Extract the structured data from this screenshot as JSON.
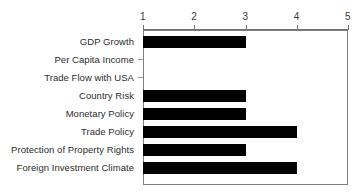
{
  "chart_data": {
    "type": "bar",
    "orientation": "horizontal",
    "title": "",
    "subtitle": "",
    "xlabel": "",
    "ylabel": "",
    "xlim": [
      1,
      5
    ],
    "x_ticks": [
      "1",
      "2",
      "3",
      "4",
      "5"
    ],
    "grid": false,
    "legend": null,
    "bar_color": "#000000",
    "axis_color": "#6f6f6f",
    "baseline_value": 1,
    "categories": [
      "GDP Growth",
      "Per Capita Income",
      "Trade Flow with USA",
      "Country Risk",
      "Monetary Policy",
      "Trade Policy",
      "Protection of Property Rights",
      "Foreign Investment Climate"
    ],
    "values": [
      3,
      1,
      1,
      3,
      3,
      4,
      3,
      4
    ],
    "bars": [
      {
        "label": "GDP Growth",
        "value": 3
      },
      {
        "label": "Per Capita Income",
        "value": 1
      },
      {
        "label": "Trade Flow with USA",
        "value": 1
      },
      {
        "label": "Country Risk",
        "value": 3
      },
      {
        "label": "Monetary Policy",
        "value": 3
      },
      {
        "label": "Trade Policy",
        "value": 4
      },
      {
        "label": "Protection of Property Rights",
        "value": 3
      },
      {
        "label": "Foreign Investment Climate",
        "value": 4
      }
    ]
  }
}
